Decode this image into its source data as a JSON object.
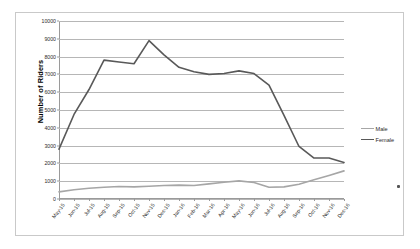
{
  "chart_data": {
    "type": "line",
    "title": "",
    "xlabel": "",
    "ylabel": "Number of Riders",
    "ylim": [
      0,
      10000
    ],
    "ytick_step": 1000,
    "yticks": [
      0,
      1000,
      2000,
      3000,
      4000,
      5000,
      6000,
      7000,
      8000,
      9000,
      10000
    ],
    "ytick_labels": [
      "0",
      "1000",
      "2000",
      "3000",
      "4000",
      "5000",
      "6000",
      "7000",
      "8000",
      "9000",
      "10000"
    ],
    "grid": true,
    "legend_position": "right",
    "categories": [
      "May-15",
      "Jun-15",
      "Jul-15",
      "Aug-15",
      "Sep-15",
      "Oct-15",
      "Nov-15",
      "Dec-15",
      "Jan-16",
      "Feb-16",
      "Mar-16",
      "Apr-16",
      "May-16",
      "Jun-16",
      "Jul-16",
      "Aug-16",
      "Sep-16",
      "Oct-16",
      "Nov-16",
      "Dec-16"
    ],
    "series": [
      {
        "name": "Male",
        "color": "#a6a6a6",
        "values": [
          400,
          520,
          600,
          660,
          700,
          680,
          720,
          760,
          780,
          760,
          850,
          940,
          1020,
          930,
          660,
          680,
          830,
          1080,
          1320,
          1580
        ]
      },
      {
        "name": "Female",
        "color": "#595959",
        "values": [
          2800,
          4750,
          6150,
          7800,
          7700,
          7600,
          8900,
          8100,
          7400,
          7150,
          7000,
          7050,
          7200,
          7050,
          6400,
          4700,
          2950,
          2300,
          2300,
          2050
        ]
      }
    ]
  },
  "legend": {
    "items": [
      {
        "label": "Male",
        "color": "#a6a6a6"
      },
      {
        "label": "Female",
        "color": "#595959"
      }
    ]
  },
  "axis": {
    "y_title": "Number of Riders"
  }
}
